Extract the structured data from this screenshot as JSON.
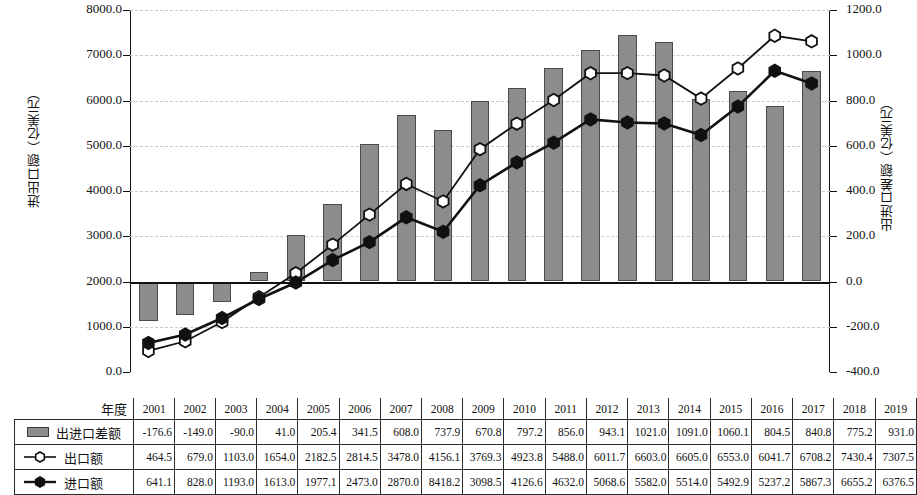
{
  "chart_data": {
    "type": "bar",
    "title": "",
    "xlabel": "年度",
    "categories": [
      "2001",
      "2002",
      "2003",
      "2004",
      "2005",
      "2006",
      "2007",
      "2008",
      "2009",
      "2010",
      "2011",
      "2012",
      "2013",
      "2014",
      "2015",
      "2016",
      "2017",
      "2018",
      "2019"
    ],
    "series": [
      {
        "name": "出进口差额",
        "type": "bar",
        "axis": "right",
        "unit": "亿美元",
        "values": [
          -176.6,
          -149.0,
          -90.0,
          41.0,
          205.4,
          341.5,
          608.0,
          737.9,
          670.8,
          797.2,
          856.0,
          943.1,
          1021.0,
          1091.0,
          1060.1,
          804.5,
          840.8,
          775.2,
          931.0
        ]
      },
      {
        "name": "出口额",
        "type": "line",
        "axis": "left",
        "unit": "亿美元",
        "marker": "hollow-hexagon",
        "values": [
          464.5,
          679.0,
          1103.0,
          1654.0,
          2182.5,
          2814.5,
          3478.0,
          4156.1,
          3769.3,
          4923.8,
          5488.0,
          6011.7,
          6603.0,
          6605.0,
          6553.0,
          6041.7,
          6708.2,
          7430.4,
          7307.5
        ]
      },
      {
        "name": "进口额",
        "type": "line",
        "axis": "left",
        "unit": "亿美元",
        "marker": "filled-hexagon",
        "values": [
          641.1,
          828.0,
          1193.0,
          1613.0,
          1977.1,
          2473.0,
          2870.0,
          8418.2,
          3098.5,
          4126.6,
          4632.0,
          5068.6,
          5582.0,
          5514.0,
          5492.9,
          5237.2,
          5867.3,
          6655.2,
          6376.5
        ],
        "plotted_values": [
          641.1,
          828.0,
          1193.0,
          1613.0,
          1977.1,
          2473.0,
          2870.0,
          3418.2,
          3098.5,
          4126.6,
          4632.0,
          5068.6,
          5582.0,
          5514.0,
          5492.9,
          5237.2,
          5867.3,
          6655.2,
          6376.5
        ]
      }
    ],
    "y_left": {
      "label": "进出口额（亿美元）",
      "min": 0,
      "max": 8000,
      "step": 1000,
      "ticks": [
        "0.0",
        "1000.0",
        "2000.0",
        "3000.0",
        "4000.0",
        "5000.0",
        "6000.0",
        "7000.0",
        "8000.0"
      ]
    },
    "y_right": {
      "label": "出进口差额（亿美元）",
      "min": -400,
      "max": 1200,
      "step": 200,
      "ticks": [
        "-400.0",
        "-200.0",
        "0.0",
        "200.0",
        "400.0",
        "600.0",
        "800.0",
        "1000.0",
        "1200.0"
      ]
    },
    "grid": true,
    "legend_position": "table-left-column",
    "colors": {
      "bar_fill": "#8c8c8c",
      "bar_stroke": "#4a4a4a",
      "line": "#111111",
      "marker_hollow_fill": "#ffffff",
      "marker_filled_fill": "#111111",
      "grid": "#c9c9c9"
    }
  },
  "table": {
    "year_header": "年度",
    "row_labels": [
      "出进口差额",
      "出口额",
      "进口额"
    ]
  }
}
